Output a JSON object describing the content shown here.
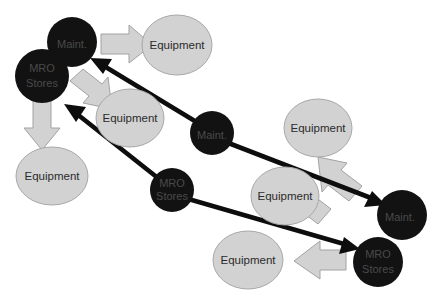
{
  "diagram": {
    "colors": {
      "dark_node": "#121212",
      "equipment_node": "#d2d2d2",
      "equipment_stroke": "#a8a8a8",
      "block_arrow": "#d2d2d2",
      "block_arrow_stroke": "#a2a2a2",
      "flow_line": "#0d0d0d",
      "dark_node_label": "#4a4a4a",
      "equipment_label": "#2b2b2b",
      "background": "#ffffff"
    },
    "labels": {
      "maintenance": "Maint.",
      "mro_line_1": "MRO",
      "mro_line_2": "Stores",
      "equipment": "Equipment"
    },
    "nodes": [
      {
        "id": "maint-top-left",
        "type": "maintenance",
        "label": "Maint.",
        "cx": 72,
        "cy": 42,
        "r": 25
      },
      {
        "id": "mro-top-left",
        "type": "mro-stores",
        "label": "MRO Stores",
        "cx": 42,
        "cy": 76,
        "r": 27
      },
      {
        "id": "equipment-top",
        "type": "equipment",
        "label": "Equipment",
        "cx": 177,
        "cy": 45,
        "rx": 35,
        "ry": 30
      },
      {
        "id": "equipment-upper-mid",
        "type": "equipment",
        "label": "Equipment",
        "cx": 130,
        "cy": 118,
        "rx": 34,
        "ry": 29
      },
      {
        "id": "equipment-left",
        "type": "equipment",
        "label": "Equipment",
        "cx": 52,
        "cy": 176,
        "rx": 36,
        "ry": 29
      },
      {
        "id": "maint-middle",
        "type": "maintenance",
        "label": "Maint.",
        "cx": 212,
        "cy": 133,
        "r": 22
      },
      {
        "id": "equipment-right",
        "type": "equipment",
        "label": "Equipment",
        "cx": 318,
        "cy": 128,
        "rx": 34,
        "ry": 29
      },
      {
        "id": "mro-middle",
        "type": "mro-stores",
        "label": "MRO Stores",
        "cx": 172,
        "cy": 190,
        "r": 22
      },
      {
        "id": "equipment-mid-low",
        "type": "equipment",
        "label": "Equipment",
        "cx": 285,
        "cy": 196,
        "rx": 34,
        "ry": 29
      },
      {
        "id": "maint-right",
        "type": "maintenance",
        "label": "Maint.",
        "cx": 402,
        "cy": 215,
        "r": 25
      },
      {
        "id": "equipment-bottom",
        "type": "equipment",
        "label": "Equipment",
        "cx": 248,
        "cy": 260,
        "rx": 35,
        "ry": 29
      },
      {
        "id": "mro-bottom-right",
        "type": "mro-stores",
        "label": "MRO Stores",
        "cx": 378,
        "cy": 262,
        "r": 25
      }
    ],
    "flow_arrows": [
      {
        "id": "flow-maint-middle-to-maint-top",
        "from": "maint-middle",
        "to": "maint-top-left",
        "style": "thick-black"
      },
      {
        "id": "flow-maint-middle-to-maint-right",
        "from": "maint-middle",
        "to": "maint-right",
        "style": "thick-black"
      },
      {
        "id": "flow-mro-middle-to-mro-top",
        "from": "mro-middle",
        "to": "mro-top-left",
        "style": "thick-black"
      },
      {
        "id": "flow-mro-middle-to-mro-bottom",
        "from": "mro-middle",
        "to": "mro-bottom-right",
        "style": "thick-black"
      }
    ],
    "block_arrows": [
      {
        "id": "block-arrow-maint-to-equipment-top",
        "from": "maint-top-left",
        "to": "equipment-top",
        "direction": "right"
      },
      {
        "id": "block-arrow-maint-to-equipment-upper-mid",
        "from": "maint-top-left",
        "to": "equipment-upper-mid",
        "direction": "down-right"
      },
      {
        "id": "block-arrow-mro-to-equipment-left",
        "from": "mro-top-left",
        "to": "equipment-left",
        "direction": "down"
      },
      {
        "id": "block-arrow-maint-right-to-equipment",
        "from": "maint-right",
        "to": "equipment-right",
        "direction": "up-left"
      },
      {
        "id": "block-arrow-mro-bottom-to-equipment-mid",
        "from": "mro-bottom-right",
        "to": "equipment-mid-low",
        "direction": "up-left"
      },
      {
        "id": "block-arrow-mro-bottom-to-equipment-bot",
        "from": "mro-bottom-right",
        "to": "equipment-bottom",
        "direction": "left"
      }
    ]
  }
}
